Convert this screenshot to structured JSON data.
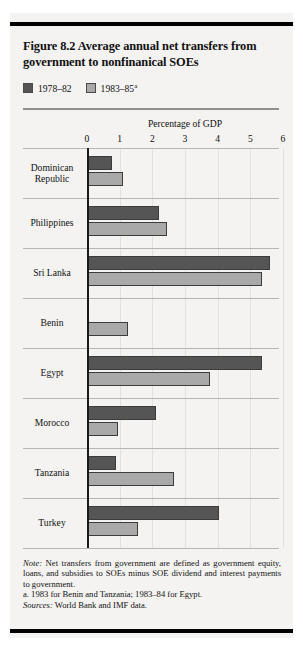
{
  "figure": {
    "title": "Figure 8.2  Average annual net transfers from government to nonfinanical SOEs",
    "legend": [
      {
        "label": "1978–82",
        "superscript": "",
        "color": "#555555",
        "key": "1978-82"
      },
      {
        "label": "1983–85",
        "superscript": "a",
        "color": "#a9a9a9",
        "key": "1983-85"
      }
    ],
    "notes": {
      "note_label": "Note:",
      "note_text": " Net transfers from government are defined as government equity, loans, and subsidies to SOEs minus SOE dividend and interest payments to government.",
      "footnote_a": "a.  1983 for Benin and Tanzania; 1983–84 for Egypt.",
      "sources_label": "Sources:",
      "sources_text": " World Bank and IMF data."
    }
  },
  "chart_data": {
    "type": "bar",
    "orientation": "horizontal",
    "title": "Figure 8.2  Average annual net transfers from government to nonfinanical SOEs",
    "xlabel": "Percentage of GDP",
    "ylabel": "",
    "xlim": [
      0,
      6
    ],
    "xticks": [
      "0",
      "1",
      "2",
      "3",
      "4",
      "5",
      "6"
    ],
    "grid": true,
    "legend_position": "top-left",
    "categories": [
      "Dominican Republic",
      "Philippines",
      "Sri Lanka",
      "Benin",
      "Egypt",
      "Morocco",
      "Tanzania",
      "Turkey"
    ],
    "category_lines": [
      [
        "Dominican",
        "Republic"
      ],
      [
        "Philippines"
      ],
      [
        "Sri Lanka"
      ],
      [
        "Benin"
      ],
      [
        "Egypt"
      ],
      [
        "Morocco"
      ],
      [
        "Tanzania"
      ],
      [
        "Turkey"
      ]
    ],
    "series": [
      {
        "name": "1978–82",
        "color": "#555555",
        "values": [
          0.75,
          2.2,
          5.6,
          0.0,
          5.35,
          2.1,
          0.9,
          4.05
        ]
      },
      {
        "name": "1983–85",
        "color": "#a9a9a9",
        "values": [
          1.1,
          2.45,
          5.35,
          1.25,
          3.75,
          0.95,
          2.65,
          1.55
        ]
      }
    ]
  }
}
